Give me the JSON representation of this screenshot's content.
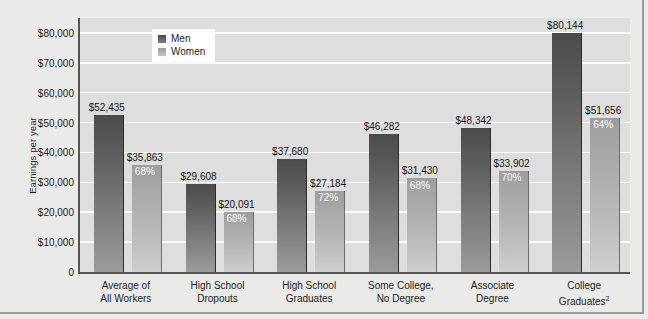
{
  "chart_data": {
    "type": "bar",
    "title": "",
    "xlabel": "",
    "ylabel": "Earnings per year",
    "ylim": [
      0,
      85000
    ],
    "ytick_values": [
      0,
      10000,
      20000,
      30000,
      40000,
      50000,
      60000,
      70000,
      80000
    ],
    "ytick_labels": [
      "0",
      "$10,000",
      "$20,000",
      "$30,000",
      "$40,000",
      "$50,000",
      "$60,000",
      "$70,000",
      "$80,000"
    ],
    "grid": true,
    "legend_position": "top-left-inside",
    "categories": [
      "Average of\nAll Workers",
      "High School\nDropouts",
      "High School\nGraduates",
      "Some College,\nNo Degree",
      "Associate\nDegree",
      "College\nGraduates"
    ],
    "series": [
      {
        "name": "Men",
        "color": "#4b4b4b",
        "values": [
          52435,
          29608,
          37680,
          46282,
          48342,
          80144
        ],
        "labels": [
          "$52,435",
          "$29,608",
          "$37,680",
          "$46,282",
          "$48,342",
          "$80,144"
        ]
      },
      {
        "name": "Women",
        "color": "#aaaaaa",
        "values": [
          35863,
          20091,
          27184,
          31430,
          33902,
          51656
        ],
        "labels": [
          "$35,863",
          "$20,091",
          "$27,184",
          "$31,430",
          "$33,902",
          "$51,656"
        ],
        "ratio_labels": [
          "68%",
          "68%",
          "72%",
          "68%",
          "70%",
          "64%"
        ]
      }
    ]
  },
  "categories_display": [
    {
      "line1": "Average of",
      "line2": "All Workers",
      "footnote": ""
    },
    {
      "line1": "High School",
      "line2": "Dropouts",
      "footnote": ""
    },
    {
      "line1": "High School",
      "line2": "Graduates",
      "footnote": ""
    },
    {
      "line1": "Some College,",
      "line2": "No Degree",
      "footnote": ""
    },
    {
      "line1": "Associate",
      "line2": "Degree",
      "footnote": ""
    },
    {
      "line1": "College",
      "line2": "Graduates",
      "footnote": "2"
    }
  ],
  "legend": {
    "items": [
      {
        "label": "Men",
        "swatch": "men"
      },
      {
        "label": "Women",
        "swatch": "women"
      }
    ]
  },
  "axis": {
    "y_title": "Earnings per year"
  },
  "colors": {
    "men_bar": "#4b4b4b",
    "women_bar": "#aaaaaa",
    "plot_background": "#dedede",
    "page_background": "#eaeae8",
    "gridline": "#fbfbfb",
    "axis_line": "#555553",
    "text": "#1d1d1d",
    "pct_text": "#ffffff"
  }
}
